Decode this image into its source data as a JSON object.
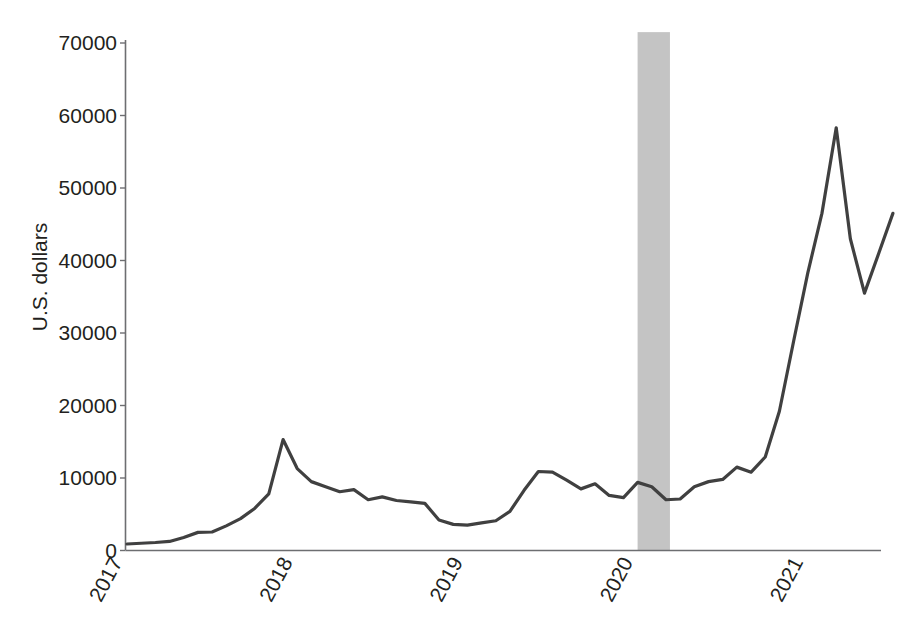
{
  "chart_data": {
    "type": "line",
    "title": "",
    "subtitle": "",
    "xlabel": "",
    "ylabel": "U.S. dollars",
    "xlim": [
      2017.0,
      2021.62
    ],
    "ylim": [
      0,
      70000
    ],
    "grid": false,
    "legend": false,
    "legend_position": "none",
    "y_ticks": [
      0,
      10000,
      20000,
      30000,
      40000,
      50000,
      60000,
      70000
    ],
    "y_tick_labels": [
      "0",
      "10000",
      "20000",
      "30000",
      "40000",
      "50000",
      "60000",
      "70000"
    ],
    "x_ticks": [
      2017,
      2018,
      2019,
      2020,
      2021
    ],
    "x_tick_labels": [
      "2017",
      "2018",
      "2019",
      "2020",
      "2021"
    ],
    "x_tick_rotation_degrees": -62,
    "line_color": "#404040",
    "line_width": 3.2,
    "axis_color": "#6d6e71",
    "shaded_band": {
      "label": "recession",
      "color": "#c4c4c4",
      "x_start": 2020.0,
      "x_end": 2020.19,
      "y_top": 71500,
      "y_bottom": 0
    },
    "x": [
      2017.0,
      2017.083,
      2017.167,
      2017.25,
      2017.333,
      2017.417,
      2017.5,
      2017.583,
      2017.667,
      2017.75,
      2017.833,
      2017.917,
      2018.0,
      2018.083,
      2018.167,
      2018.25,
      2018.333,
      2018.417,
      2018.5,
      2018.583,
      2018.667,
      2018.75,
      2018.833,
      2018.917,
      2019.0,
      2019.083,
      2019.167,
      2019.25,
      2019.333,
      2019.417,
      2019.5,
      2019.583,
      2019.667,
      2019.75,
      2019.833,
      2019.917,
      2020.0,
      2020.083,
      2020.167,
      2020.25,
      2020.333,
      2020.417,
      2020.5,
      2020.583,
      2020.667,
      2020.75,
      2020.833,
      2020.917,
      2021.0,
      2021.083,
      2021.167,
      2021.25,
      2021.333,
      2021.417,
      2021.5
    ],
    "values": [
      900,
      1000,
      1100,
      1250,
      1800,
      2500,
      2550,
      3400,
      4400,
      5800,
      7800,
      15300,
      11300,
      9500,
      8800,
      8100,
      8400,
      7000,
      7400,
      6900,
      6700,
      6500,
      4200,
      3600,
      3500,
      3800,
      4100,
      5400,
      8300,
      10900,
      10800,
      9700,
      8500,
      9200,
      7600,
      7300,
      9400,
      8800,
      7000,
      7100,
      8800,
      9500,
      9800,
      11500,
      10800,
      12900,
      19200,
      28900,
      38300,
      46500,
      58300,
      43000,
      35500,
      41000,
      46500
    ],
    "note_series_name": "Bitcoin price"
  },
  "axis": {
    "y_title": "U.S. dollars"
  }
}
